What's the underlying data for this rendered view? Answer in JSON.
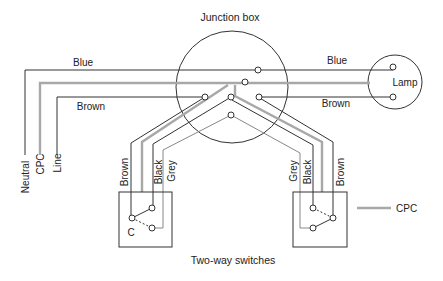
{
  "diagram": {
    "title": "Junction box",
    "caption": "Two-way switches",
    "lamp_label": "Lamp",
    "supply_labels": {
      "neutral": "Neutral",
      "cpc": "CPC",
      "line": "Line"
    },
    "wire_labels": {
      "blue_left": "Blue",
      "brown_left": "Brown",
      "blue_right": "Blue",
      "brown_right": "Brown"
    },
    "left_switch": {
      "labels": [
        "Brown",
        "Black",
        "Grey"
      ],
      "common": "C"
    },
    "right_switch": {
      "labels": [
        "Grey",
        "Black",
        "Brown"
      ]
    },
    "legend": {
      "cpc": "CPC"
    },
    "colors": {
      "conductor": "#333333",
      "cpc": "#a8a8a8",
      "strapper_grey": "#888888"
    }
  }
}
